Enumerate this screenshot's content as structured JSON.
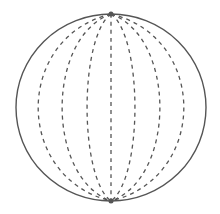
{
  "diagram": {
    "type": "sphere-with-meridians",
    "background": "#ffffff",
    "outline": {
      "cx": 111,
      "cy": 107.5,
      "rx": 95,
      "ry": 93.5,
      "stroke": "#555555",
      "stroke_width": 1.4
    },
    "poles": {
      "top": [
        111,
        14
      ],
      "bottom": [
        111,
        201
      ]
    },
    "meridians": {
      "count": 7,
      "stroke": "#555555",
      "stroke_width": 1.3,
      "dash": "4 4",
      "equator_offsets": [
        -73,
        -49,
        -24,
        0,
        24,
        49,
        73
      ]
    }
  }
}
